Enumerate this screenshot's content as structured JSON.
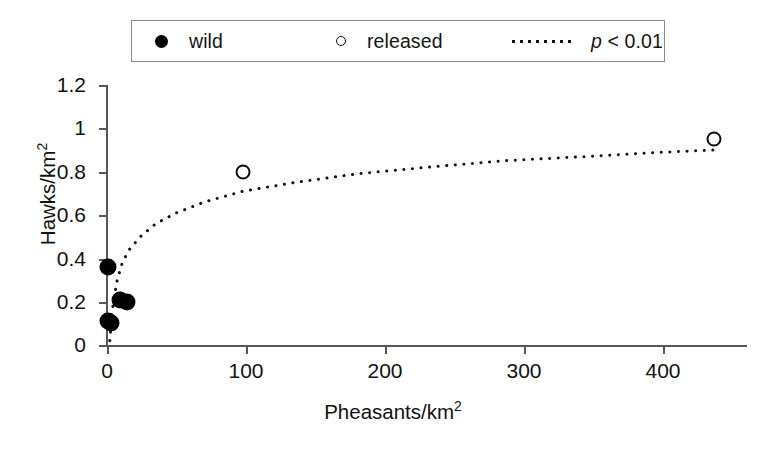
{
  "legend": {
    "entries": [
      {
        "label": "wild",
        "key": "filled-circle-icon"
      },
      {
        "label": "released",
        "key": "open-circle-icon"
      },
      {
        "label_italic": "p",
        "label_rest": " < 0.01",
        "key": "dotted-line-icon"
      }
    ]
  },
  "axes": {
    "y": {
      "label_main": "Hawks/km",
      "label_sup": "2",
      "ticks": [
        "0",
        "0.2",
        "0.4",
        "0.6",
        "0.8",
        "1",
        "1.2"
      ],
      "min": 0,
      "max": 1.2
    },
    "x": {
      "label_main": "Pheasants/km",
      "label_sup": "2",
      "ticks": [
        "0",
        "100",
        "200",
        "300",
        "400"
      ],
      "min": 0,
      "max": 460
    }
  },
  "chart_data": {
    "type": "scatter",
    "title": "",
    "xlabel": "Pheasants/km2",
    "ylabel": "Hawks/km2",
    "xlim": [
      0,
      460
    ],
    "ylim": [
      0,
      1.2
    ],
    "grid": false,
    "legend_position": "top",
    "series": [
      {
        "name": "wild",
        "marker": "filled-circle",
        "points": [
          {
            "x": 1,
            "y": 0.36
          },
          {
            "x": 1,
            "y": 0.11
          },
          {
            "x": 3,
            "y": 0.1
          },
          {
            "x": 9,
            "y": 0.21
          },
          {
            "x": 14,
            "y": 0.2
          }
        ]
      },
      {
        "name": "released",
        "marker": "open-circle",
        "points": [
          {
            "x": 98,
            "y": 0.8
          },
          {
            "x": 437,
            "y": 0.95
          }
        ]
      }
    ],
    "annotations": [
      {
        "name": "fit-curve",
        "type": "logarithmic-fit",
        "style": "dotted",
        "label": "p < 0.01",
        "points": [
          {
            "x": 2,
            "y": 0.02
          },
          {
            "x": 4,
            "y": 0.17
          },
          {
            "x": 7,
            "y": 0.29
          },
          {
            "x": 11,
            "y": 0.38
          },
          {
            "x": 16,
            "y": 0.44
          },
          {
            "x": 24,
            "y": 0.5
          },
          {
            "x": 35,
            "y": 0.56
          },
          {
            "x": 50,
            "y": 0.61
          },
          {
            "x": 70,
            "y": 0.66
          },
          {
            "x": 98,
            "y": 0.71
          },
          {
            "x": 135,
            "y": 0.75
          },
          {
            "x": 180,
            "y": 0.79
          },
          {
            "x": 230,
            "y": 0.82
          },
          {
            "x": 285,
            "y": 0.85
          },
          {
            "x": 345,
            "y": 0.87
          },
          {
            "x": 400,
            "y": 0.89
          },
          {
            "x": 437,
            "y": 0.9
          }
        ]
      }
    ]
  }
}
